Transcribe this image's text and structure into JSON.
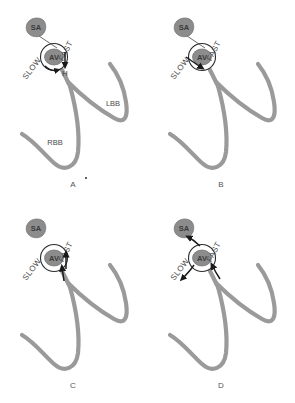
{
  "figure": {
    "panel_count": 4
  },
  "style": {
    "tract_color": "#9a9a9a",
    "node_fill": "#8c8c8c",
    "node_stroke": "#2b2b2b",
    "arrow_color": "#1a1a1a",
    "text_color": "#4a4a4a",
    "background": "#ffffff",
    "tract_width": 4.2
  },
  "labels": {
    "sa_node": "SA",
    "av_node": "AV",
    "fast_pathway": "FAST",
    "slow_pathway": "SLOW",
    "his_bundle": "H",
    "left_bundle_branch": "LBB",
    "right_bundle_branch": "RBB"
  },
  "panels": [
    {
      "id": "A",
      "letter": "A",
      "show_sa_connection": true,
      "show_branch_labels": true,
      "show_his_label": true,
      "arrows": [
        "fast-antegrade-down",
        "slow-antegrade-down"
      ],
      "description": "Normal sinus conduction from SA node through AV node via fast pathway to His bundle and bundle branches"
    },
    {
      "id": "B",
      "letter": "B",
      "show_sa_connection": true,
      "show_branch_labels": false,
      "show_his_label": false,
      "arrows": [
        "slow-antegrade-into-node"
      ],
      "description": "Premature beat blocks in fast pathway and conducts antegrade down the slow pathway"
    },
    {
      "id": "C",
      "letter": "C",
      "show_sa_connection": false,
      "show_branch_labels": false,
      "show_his_label": false,
      "arrows": [
        "fast-retrograde-up",
        "fast-retrograde-up-inner"
      ],
      "description": "Retrograde conduction back up the fast pathway to the atrium"
    },
    {
      "id": "D",
      "letter": "D",
      "show_sa_connection": false,
      "show_branch_labels": false,
      "show_his_label": false,
      "arrows": [
        "reentry-loop-upper-left",
        "reentry-loop-slow-down",
        "reentry-loop-fast-up"
      ],
      "description": "Sustained reentrant circuit looping between slow and fast pathways"
    }
  ]
}
